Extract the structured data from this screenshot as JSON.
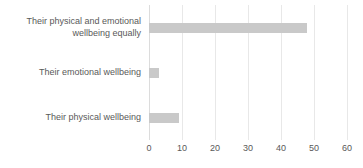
{
  "chart_data": {
    "type": "bar",
    "orientation": "horizontal",
    "title": "",
    "subtitle": "",
    "xlabel": "",
    "ylabel": "",
    "categories": [
      "Their physical and emotional\nwellbeing equally",
      "Their emotional wellbeing",
      "Their physical wellbeing"
    ],
    "values": [
      48,
      3,
      9
    ],
    "xlim": [
      0,
      60
    ],
    "xticks": [
      0,
      10,
      20,
      30,
      40,
      50,
      60
    ],
    "xtick_labels": [
      "0",
      "10",
      "20",
      "30",
      "40",
      "50",
      "60"
    ],
    "grid": "vertical",
    "legend": "none",
    "bar_color": "#c9c9c9",
    "gridline_color": "#e8e8e8",
    "text_color": "#595959",
    "background": "#ffffff"
  }
}
